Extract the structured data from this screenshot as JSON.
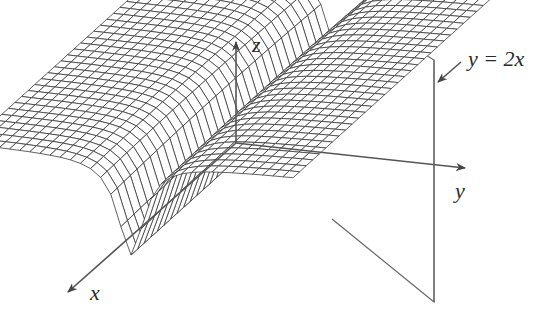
{
  "figure": {
    "axes": {
      "x_label": "x",
      "y_label": "y",
      "z_label": "z"
    },
    "plane_label": "y = 2x",
    "colors": {
      "mesh": "#3a3a3a",
      "axis": "#555555",
      "plane": "#666666",
      "background": "#ffffff"
    }
  }
}
